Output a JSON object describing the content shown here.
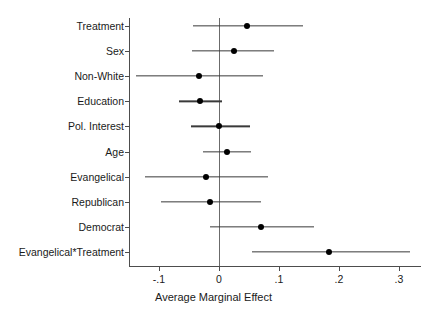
{
  "chart_data": {
    "type": "scatter",
    "title": "",
    "subtitle": "",
    "xlabel": "Average Marginal Effect",
    "ylabel": "",
    "orientation": "horizontal",
    "grid": false,
    "legend": null,
    "xlim": [
      -0.145,
      0.32
    ],
    "xticks": [
      -0.1,
      0,
      0.1,
      0.2,
      0.3
    ],
    "xticklabels": [
      "-.1",
      "0",
      ".1",
      ".2",
      ".3"
    ],
    "reference_line": 0,
    "categories": [
      "Treatment",
      "Sex",
      "Non-White",
      "Education",
      "Pol. Interest",
      "Age",
      "Evangelical",
      "Republican",
      "Democrat",
      "Evangelical*Treatment"
    ],
    "series": [
      {
        "name": "Average Marginal Effect",
        "estimates": [
          0.047,
          0.025,
          -0.033,
          -0.032,
          0.0,
          0.013,
          -0.022,
          -0.015,
          0.07,
          0.183
        ],
        "ci_low": [
          -0.043,
          -0.045,
          -0.138,
          -0.066,
          -0.047,
          -0.027,
          -0.123,
          -0.097,
          -0.015,
          0.055
        ],
        "ci_high": [
          0.14,
          0.091,
          0.073,
          0.005,
          0.052,
          0.053,
          0.082,
          0.07,
          0.158,
          0.318
        ]
      }
    ],
    "points": [
      {
        "label": "Treatment",
        "estimate": 0.047,
        "ci_low": -0.043,
        "ci_high": 0.14
      },
      {
        "label": "Sex",
        "estimate": 0.025,
        "ci_low": -0.045,
        "ci_high": 0.091
      },
      {
        "label": "Non-White",
        "estimate": -0.033,
        "ci_low": -0.138,
        "ci_high": 0.073
      },
      {
        "label": "Education",
        "estimate": -0.032,
        "ci_low": -0.066,
        "ci_high": 0.005
      },
      {
        "label": "Pol. Interest",
        "estimate": 0.0,
        "ci_low": -0.047,
        "ci_high": 0.052
      },
      {
        "label": "Age",
        "estimate": 0.013,
        "ci_low": -0.027,
        "ci_high": 0.053
      },
      {
        "label": "Evangelical",
        "estimate": -0.022,
        "ci_low": -0.123,
        "ci_high": 0.082
      },
      {
        "label": "Republican",
        "estimate": -0.015,
        "ci_low": -0.097,
        "ci_high": 0.07
      },
      {
        "label": "Democrat",
        "estimate": 0.07,
        "ci_low": -0.015,
        "ci_high": 0.158
      },
      {
        "label": "Evangelical*Treatment",
        "estimate": 0.183,
        "ci_low": 0.055,
        "ci_high": 0.318
      }
    ],
    "colors": {
      "point": "#000000",
      "interval": "#3a3a3a",
      "axis": "#4d4d4d",
      "reference": "#6b6b6b",
      "background": "#ffffff",
      "text": "#1a1a1a"
    }
  }
}
